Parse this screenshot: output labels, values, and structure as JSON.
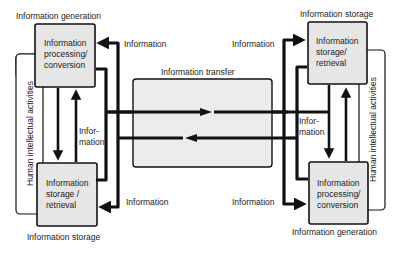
{
  "diagram": {
    "left": {
      "top_caption": "Information generation",
      "top_box": [
        "Information",
        "processing/",
        "conversion"
      ],
      "bottom_box": [
        "Information",
        "storage /",
        "retrieval"
      ],
      "bottom_caption": "Information storage",
      "side_label": "Human intellectual activities",
      "vertical_flow_label": [
        "Infor-",
        "mation"
      ],
      "top_arrow_label": "Information",
      "bottom_arrow_label": "Information"
    },
    "center": {
      "title": "Information transfer"
    },
    "right": {
      "top_caption": "Information storage",
      "top_box": [
        "Information",
        "storage/",
        "retrieval"
      ],
      "bottom_box": [
        "Information",
        "processing/",
        "conversion"
      ],
      "bottom_caption": "Information generation",
      "side_label": "Human intellectual activities",
      "vertical_flow_label": [
        "Infor-",
        "mation"
      ],
      "top_arrow_label": "Information",
      "bottom_arrow_label": "Information"
    },
    "colors": {
      "box_fill": "#e6e6e6",
      "line": "#111111",
      "background": "#ffffff"
    }
  }
}
